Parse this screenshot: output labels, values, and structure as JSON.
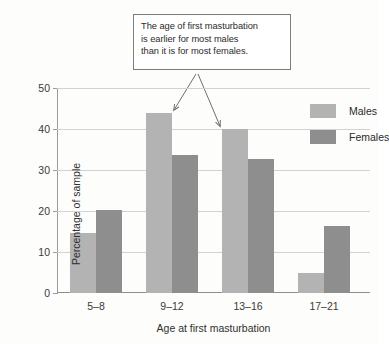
{
  "chart_data": {
    "type": "bar",
    "title": "",
    "xlabel": "Age at first masturbation",
    "ylabel": "Percentage of sample",
    "categories": [
      "5–8",
      "9–12",
      "13–16",
      "17–21"
    ],
    "series": [
      {
        "name": "Males",
        "color": "#b3b3b3",
        "values": [
          14.7,
          44.0,
          40.0,
          5.0
        ]
      },
      {
        "name": "Females",
        "color": "#8e8e8e",
        "values": [
          20.3,
          33.7,
          32.7,
          16.3
        ]
      }
    ],
    "ylim": [
      0,
      50
    ],
    "yticks": [
      "0",
      "10",
      "20",
      "30",
      "40",
      "50"
    ],
    "ytick_values": [
      0,
      10,
      20,
      30,
      40,
      50
    ],
    "grid": true,
    "legend_position": "top-right-inside",
    "annotations": [
      {
        "name": "callout",
        "lines": [
          "The age of first masturbation",
          "is earlier for most males",
          "than it is for most females."
        ],
        "points_to": [
          "9–12 Males",
          "13–16 Males"
        ]
      }
    ]
  }
}
